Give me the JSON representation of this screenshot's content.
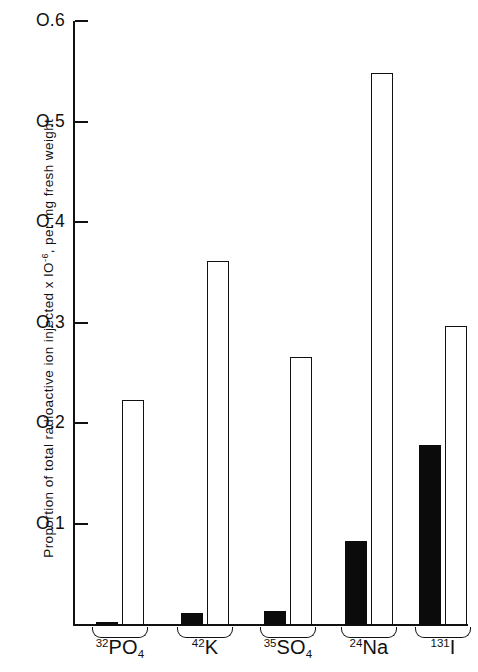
{
  "chart_data": {
    "type": "bar",
    "title": "",
    "subtitle": "",
    "xlabel": "",
    "ylabel": "Proportion of total radioactive ion injected x 10-6, per mg fresh weight",
    "ylabel_parts": {
      "before": "Proportion of total  radioactive  ion injected  x  IO",
      "exponent": "-6",
      "after": ", per mg fresh weight"
    },
    "categories": [
      "32PO4",
      "42K",
      "35SO4",
      "24Na",
      "131I"
    ],
    "category_labels": [
      {
        "isotope": "32",
        "element": "PO",
        "subscript": "4"
      },
      {
        "isotope": "42",
        "element": "K",
        "subscript": ""
      },
      {
        "isotope": "35",
        "element": "SO",
        "subscript": "4"
      },
      {
        "isotope": "24",
        "element": "Na",
        "subscript": ""
      },
      {
        "isotope": "131",
        "element": "I",
        "subscript": ""
      }
    ],
    "series": [
      {
        "name": "solid",
        "fill": "solid",
        "values": [
          0.002,
          0.012,
          0.014,
          0.084,
          0.179
        ]
      },
      {
        "name": "open",
        "fill": "open",
        "values": [
          0.224,
          0.362,
          0.267,
          0.549,
          0.298
        ]
      }
    ],
    "ylim": [
      0,
      0.6
    ],
    "yticks": [
      0.1,
      0.2,
      0.3,
      0.4,
      0.5,
      0.6
    ],
    "ytick_labels": [
      "O.1",
      "O.2",
      "O.3",
      "O.4",
      "O.5",
      "O.6"
    ],
    "grid": false,
    "legend": "none",
    "colors": {
      "solid": "#0b0b0b",
      "open": "#ffffff",
      "axis": "#111111"
    }
  }
}
